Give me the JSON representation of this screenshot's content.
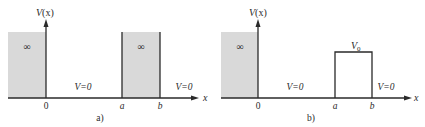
{
  "figure": {
    "panels": [
      {
        "id": "a",
        "caption": "a)",
        "y_axis_label": "V(x)",
        "x_axis_label": "x",
        "tick_labels": [
          "0",
          "a",
          "b"
        ],
        "regions": [
          {
            "label": "∞",
            "kind": "infinite-wall",
            "range": "x < 0"
          },
          {
            "label": "V=0",
            "kind": "zero-potential",
            "range": "0 < x < a"
          },
          {
            "label": "∞",
            "kind": "infinite-barrier",
            "range": "a < x < b"
          },
          {
            "label": "V=0",
            "kind": "zero-potential",
            "range": "x > b"
          }
        ]
      },
      {
        "id": "b",
        "caption": "b)",
        "y_axis_label": "V(x)",
        "x_axis_label": "x",
        "tick_labels": [
          "0",
          "a",
          "b"
        ],
        "regions": [
          {
            "label": "∞",
            "kind": "infinite-wall",
            "range": "x < 0"
          },
          {
            "label": "V=0",
            "kind": "zero-potential",
            "range": "0 < x < a"
          },
          {
            "label": "V0",
            "kind": "finite-barrier",
            "range": "a < x < b"
          },
          {
            "label": "V=0",
            "kind": "zero-potential",
            "range": "x > b"
          }
        ]
      }
    ],
    "labels": {
      "a": {
        "caption": "a)",
        "V": "V",
        "x_paren": "(x)",
        "x": "x",
        "zero": "0",
        "tick_a": "a",
        "tick_b": "b",
        "inf_left": "∞",
        "inf_barrier": "∞",
        "v_eq_zero_1": "V=0",
        "v_eq_zero_2": "V=0"
      },
      "b": {
        "caption": "b)",
        "V": "V",
        "x_paren": "(x)",
        "x": "x",
        "zero": "0",
        "tick_a": "a",
        "tick_b": "b",
        "inf_left": "∞",
        "v0_main": "V",
        "v0_sub": "0",
        "v_eq_zero_1": "V=0",
        "v_eq_zero_2": "V=0"
      }
    },
    "colors": {
      "fill_gray": "#d9d9d9",
      "line": "#2a2a2a"
    }
  }
}
